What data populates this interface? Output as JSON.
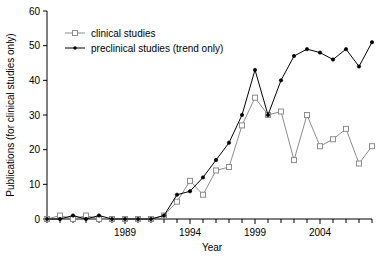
{
  "chart_data": {
    "type": "line",
    "title": "",
    "xlabel": "Year",
    "ylabel": "Publications (for clinical studies only)",
    "xlim": [
      1983,
      2008
    ],
    "ylim": [
      0,
      60
    ],
    "xticks": [
      1989,
      1994,
      1999,
      2004
    ],
    "xtick_labels": [
      "1989",
      "1994",
      "1999",
      "2004"
    ],
    "yticks": [
      0,
      10,
      20,
      30,
      40,
      50,
      60
    ],
    "ytick_labels": [
      "0",
      "10",
      "20",
      "30",
      "40",
      "50",
      "60"
    ],
    "grid": false,
    "legend_position": "top-left",
    "x": [
      1983,
      1984,
      1985,
      1986,
      1987,
      1988,
      1989,
      1990,
      1991,
      1992,
      1993,
      1994,
      1995,
      1996,
      1997,
      1998,
      1999,
      2000,
      2001,
      2002,
      2003,
      2004,
      2005,
      2006,
      2007,
      2008
    ],
    "series": [
      {
        "name": "clinical studies",
        "marker": "open-square",
        "color": "#8c8c8c",
        "values": [
          0,
          1,
          0,
          1,
          0,
          0,
          0,
          0,
          0,
          1,
          5,
          11,
          7,
          14,
          15,
          27,
          35,
          30,
          31,
          17,
          30,
          21,
          23,
          26,
          16,
          21
        ]
      },
      {
        "name": "preclinical studies (trend only)",
        "marker": "filled-dot",
        "color": "#000000",
        "values": [
          0,
          0,
          1,
          0,
          1,
          0,
          0,
          0,
          0,
          1,
          7,
          8,
          12,
          17,
          22,
          30,
          43,
          30,
          40,
          47,
          49,
          48,
          46,
          49,
          44,
          51
        ]
      }
    ]
  },
  "legend": {
    "items": [
      {
        "label": "clinical studies"
      },
      {
        "label": "preclinical studies (trend only)"
      }
    ]
  }
}
